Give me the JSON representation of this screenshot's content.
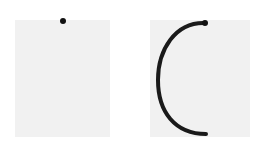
{
  "panels": [
    {
      "id": "left",
      "background": "#f1f1f1",
      "elements": [
        {
          "type": "dot",
          "cx": 63,
          "cy": 21,
          "r": 3,
          "color": "#111111"
        }
      ]
    },
    {
      "id": "right",
      "background": "#f1f1f1",
      "elements": [
        {
          "type": "dot",
          "cx": 205,
          "cy": 23,
          "r": 3,
          "color": "#111111"
        },
        {
          "type": "arc",
          "path": "M205 23 C 175 22, 158 50, 158 80 C 158 112, 175 134, 206 134",
          "stroke": "#1a1a1a",
          "width": 4
        }
      ]
    }
  ]
}
